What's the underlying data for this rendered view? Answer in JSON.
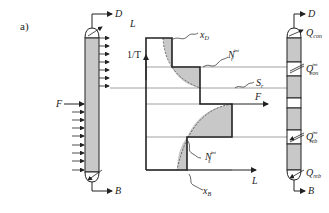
{
  "panel_label": "a)",
  "left_column": {
    "top_product": "D",
    "bottom_product": "B",
    "feed": "F"
  },
  "chart": {
    "x_axis_label": "L",
    "y_axis_label": "1/T",
    "top_axis_label": "L",
    "annotations": {
      "xD": "x",
      "xD_sub": "D",
      "xB": "x",
      "xB_sub": "B",
      "Nr": "N",
      "Nr_sup": "int",
      "Nr_sub": "r",
      "Ns": "N",
      "Ns_sup": "int",
      "Ns_sub": "s",
      "Sr": "S",
      "Sr_sub": "r",
      "feed": "F"
    }
  },
  "right_column": {
    "top_product": "D",
    "bottom_product": "B",
    "q_con": "Q",
    "q_con_sub": "con",
    "q_con_int": "Q",
    "q_con_int_sup": "int",
    "q_con_int_sub": "con",
    "q_reb_int": "Q",
    "q_reb_int_sup": "int",
    "q_reb_int_sub": "reb",
    "q_reb": "Q",
    "q_reb_sub": "reb"
  },
  "colors": {
    "line": "#222222",
    "fill": "#c8c8c8",
    "thin": "#888888"
  }
}
